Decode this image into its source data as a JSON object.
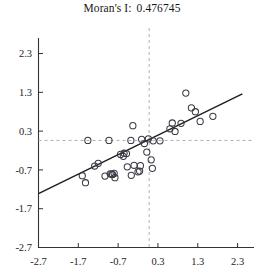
{
  "figure": {
    "title_label": "Moran's I:",
    "title_value": "0.476745",
    "background_color": "#ffffff"
  },
  "chart_data": {
    "type": "scatter",
    "xlabel": "",
    "ylabel": "",
    "xlim": [
      -2.7,
      2.7
    ],
    "ylim": [
      -2.7,
      2.7
    ],
    "xticks": [
      "-2.7",
      "-1.7",
      "-0.7",
      "0.3",
      "1.3",
      "2.3"
    ],
    "xtick_values": [
      -2.7,
      -1.7,
      -0.7,
      0.3,
      1.3,
      2.3
    ],
    "yticks": [
      "-2.7",
      "-1.7",
      "-0.7",
      "0.3",
      "1.3",
      "2.3"
    ],
    "ytick_values": [
      -2.7,
      -1.7,
      -0.7,
      0.3,
      1.3,
      2.3
    ],
    "grid": false,
    "legend": null,
    "marker_style": "open-circle",
    "marker_color": "#3a3a46",
    "marker_radius_px": 3.1,
    "reference_lines": {
      "vertical_x": 0.08,
      "horizontal_y": 0.06,
      "style": "dashed",
      "color": "#b0b0b0"
    },
    "fit_line": {
      "name": "regression-line",
      "slope": 0.5024,
      "intercept": 0.0447,
      "x_start": -2.7,
      "x_end": 2.42,
      "color": "#202020"
    },
    "points": [
      [
        -1.46,
        0.06
      ],
      [
        -0.93,
        0.06
      ],
      [
        -0.38,
        0.06
      ],
      [
        -0.33,
        0.44
      ],
      [
        0.18,
        0.05
      ],
      [
        0.35,
        0.05
      ],
      [
        -1.6,
        -0.85
      ],
      [
        -1.52,
        -1.03
      ],
      [
        -1.29,
        -0.6
      ],
      [
        -1.2,
        -0.53
      ],
      [
        -1.03,
        -0.86
      ],
      [
        -0.9,
        -0.8
      ],
      [
        -0.86,
        -0.81
      ],
      [
        -0.84,
        -0.82
      ],
      [
        -0.8,
        -0.79
      ],
      [
        -0.78,
        -0.9
      ],
      [
        -0.64,
        -0.3
      ],
      [
        -0.57,
        -0.35
      ],
      [
        -0.55,
        -0.27
      ],
      [
        -0.49,
        -0.28
      ],
      [
        -0.47,
        -0.62
      ],
      [
        -0.37,
        -0.84
      ],
      [
        -0.3,
        -0.58
      ],
      [
        -0.2,
        -0.75
      ],
      [
        -0.16,
        -0.73
      ],
      [
        -0.14,
        -0.59
      ],
      [
        0.02,
        -0.24
      ],
      [
        0.13,
        -0.44
      ],
      [
        0.16,
        -0.66
      ],
      [
        0.6,
        0.36
      ],
      [
        0.66,
        0.51
      ],
      [
        0.73,
        0.29
      ],
      [
        0.88,
        0.5
      ],
      [
        1.0,
        1.28
      ],
      [
        1.14,
        0.9
      ],
      [
        1.24,
        0.8
      ],
      [
        1.36,
        0.55
      ],
      [
        1.68,
        0.68
      ],
      [
        -0.11,
        0.09
      ],
      [
        -0.04,
        -0.02
      ],
      [
        0.06,
        0.1
      ]
    ]
  }
}
